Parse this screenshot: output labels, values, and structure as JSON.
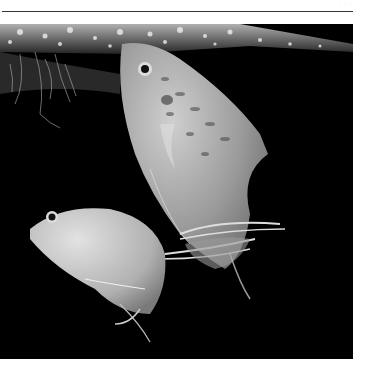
{
  "page": {
    "header_text": "· · ·",
    "background": "#ffffff",
    "rule_color": "#333333"
  },
  "photo": {
    "subject": "two gourami fish swimming in dark water",
    "description": "Grayscale photograph: a large speckled fish angled upward on the right with long trailing ventral fins, a smaller pale fish lower left, surface bubbles along the top, floating plant roots at top left, black background",
    "colors": {
      "water": "#000000",
      "fish_body": "#b8b8b8",
      "bubbles": "#e0e0e0"
    }
  }
}
